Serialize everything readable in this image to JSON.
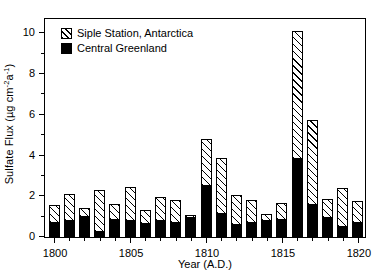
{
  "chart_data": {
    "type": "bar",
    "stacked": true,
    "title": "",
    "xlabel": "Year (A.D.)",
    "ylabel": "Sulfate Flux (µg cm⁻²a⁻¹)",
    "ylabel_parts": {
      "prefix": "Sulfate Flux (µg cm",
      "sup1": "-2",
      "mid": "a",
      "sup2": "-1",
      "suffix": ")"
    },
    "xlim": [
      1799.4,
      1820.6
    ],
    "ylim": [
      0,
      10.7
    ],
    "yticks": [
      0,
      2,
      4,
      6,
      8,
      10
    ],
    "yticks_minor": [
      1,
      3,
      5,
      7,
      9
    ],
    "xticks": [
      1800,
      1805,
      1810,
      1815,
      1820
    ],
    "xticks_minor": [
      1801,
      1802,
      1803,
      1804,
      1806,
      1807,
      1808,
      1809,
      1811,
      1812,
      1813,
      1814,
      1816,
      1817,
      1818,
      1819
    ],
    "grid": false,
    "legend_position": "top-left",
    "categories": [
      1800,
      1801,
      1802,
      1803,
      1804,
      1805,
      1806,
      1807,
      1808,
      1809,
      1810,
      1811,
      1812,
      1813,
      1814,
      1815,
      1816,
      1817,
      1818,
      1819,
      1820
    ],
    "series": [
      {
        "name": "Central Greenland",
        "color": "#000000",
        "fill": "solid",
        "values": [
          0.7,
          0.8,
          1.0,
          0.25,
          0.85,
          0.8,
          0.65,
          0.8,
          0.7,
          0.95,
          2.5,
          1.15,
          0.6,
          0.7,
          0.8,
          0.85,
          3.85,
          1.55,
          0.95,
          0.5,
          0.7
        ]
      },
      {
        "name": "Siple Station, Antarctica",
        "color": "#ffffff",
        "fill": "hatched",
        "values": [
          0.85,
          1.3,
          0.4,
          2.05,
          0.75,
          1.65,
          0.7,
          1.15,
          1.1,
          0.15,
          2.3,
          2.75,
          1.45,
          1.1,
          0.35,
          0.8,
          6.25,
          4.2,
          0.9,
          1.9,
          1.05
        ]
      }
    ],
    "totals": [
      1.55,
      2.1,
      1.4,
      2.3,
      1.6,
      2.45,
      1.35,
      1.95,
      1.8,
      1.1,
      4.8,
      3.9,
      2.05,
      1.8,
      1.15,
      1.65,
      10.1,
      5.75,
      1.85,
      2.4,
      1.75
    ]
  },
  "legend": {
    "items": [
      {
        "label": "Siple Station, Antarctica",
        "swatch": "hatched"
      },
      {
        "label": "Central Greenland",
        "swatch": "solid"
      }
    ]
  }
}
